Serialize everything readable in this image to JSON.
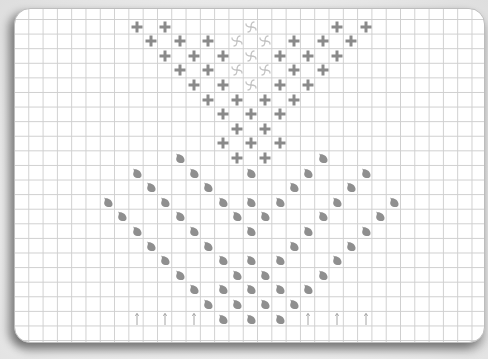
{
  "board": {
    "cell_w": 14.3,
    "cell_h": 14.6,
    "origin_x": 7,
    "origin_y": 11,
    "colors": {
      "cross": "#8a8a8a",
      "pinwheel": "#c4c4c4",
      "leaf": "#8f8f8f",
      "arrow": "#9a9a9a",
      "grid": "#cfcfcf"
    }
  },
  "pieces": {
    "cross": [
      [
        9,
        1
      ],
      [
        11,
        1
      ],
      [
        23,
        1
      ],
      [
        25,
        1
      ],
      [
        10,
        2
      ],
      [
        12,
        2
      ],
      [
        14,
        2
      ],
      [
        20,
        2
      ],
      [
        22,
        2
      ],
      [
        24,
        2
      ],
      [
        11,
        3
      ],
      [
        13,
        3
      ],
      [
        15,
        3
      ],
      [
        19,
        3
      ],
      [
        21,
        3
      ],
      [
        23,
        3
      ],
      [
        12,
        4
      ],
      [
        14,
        4
      ],
      [
        20,
        4
      ],
      [
        22,
        4
      ],
      [
        13,
        5
      ],
      [
        15,
        5
      ],
      [
        19,
        5
      ],
      [
        21,
        5
      ],
      [
        14,
        6
      ],
      [
        16,
        6
      ],
      [
        18,
        6
      ],
      [
        20,
        6
      ],
      [
        15,
        7
      ],
      [
        17,
        7
      ],
      [
        19,
        7
      ],
      [
        16,
        8
      ],
      [
        18,
        8
      ],
      [
        15,
        9
      ],
      [
        17,
        9
      ],
      [
        19,
        9
      ],
      [
        16,
        10
      ],
      [
        18,
        10
      ]
    ],
    "pinwheel": [
      [
        17,
        1
      ],
      [
        16,
        2
      ],
      [
        18,
        2
      ],
      [
        17,
        3
      ],
      [
        16,
        4
      ],
      [
        18,
        4
      ],
      [
        17,
        5
      ]
    ],
    "leaf": [
      [
        12,
        10
      ],
      [
        22,
        10
      ],
      [
        9,
        11
      ],
      [
        13,
        11
      ],
      [
        17,
        11
      ],
      [
        21,
        11
      ],
      [
        25,
        11
      ],
      [
        10,
        12
      ],
      [
        14,
        12
      ],
      [
        20,
        12
      ],
      [
        24,
        12
      ],
      [
        7,
        13
      ],
      [
        11,
        13
      ],
      [
        15,
        13
      ],
      [
        17,
        13
      ],
      [
        19,
        13
      ],
      [
        23,
        13
      ],
      [
        27,
        13
      ],
      [
        8,
        14
      ],
      [
        12,
        14
      ],
      [
        16,
        14
      ],
      [
        18,
        14
      ],
      [
        22,
        14
      ],
      [
        26,
        14
      ],
      [
        9,
        15
      ],
      [
        13,
        15
      ],
      [
        17,
        15
      ],
      [
        21,
        15
      ],
      [
        25,
        15
      ],
      [
        10,
        16
      ],
      [
        14,
        16
      ],
      [
        20,
        16
      ],
      [
        24,
        16
      ],
      [
        11,
        17
      ],
      [
        15,
        17
      ],
      [
        17,
        17
      ],
      [
        19,
        17
      ],
      [
        23,
        17
      ],
      [
        12,
        18
      ],
      [
        16,
        18
      ],
      [
        18,
        18
      ],
      [
        22,
        18
      ],
      [
        13,
        19
      ],
      [
        15,
        19
      ],
      [
        17,
        19
      ],
      [
        19,
        19
      ],
      [
        21,
        19
      ],
      [
        14,
        20
      ],
      [
        16,
        20
      ],
      [
        18,
        20
      ],
      [
        20,
        20
      ],
      [
        15,
        21
      ],
      [
        17,
        21
      ],
      [
        19,
        21
      ]
    ],
    "arrow": [
      [
        9,
        21
      ],
      [
        11,
        21
      ],
      [
        13,
        21
      ],
      [
        21,
        21
      ],
      [
        23,
        21
      ],
      [
        25,
        21
      ]
    ]
  }
}
